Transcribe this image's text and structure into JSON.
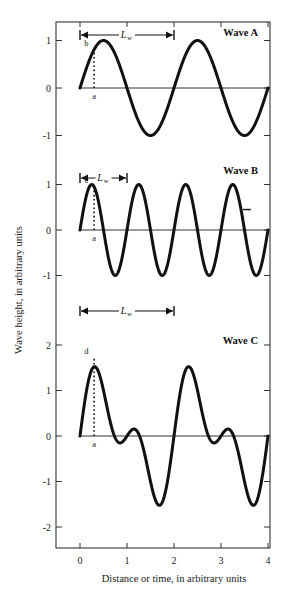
{
  "figure": {
    "xlabel": "Distance or time, in arbitrary units",
    "ylabel": "Wave height, in arbitrary units",
    "x_ticks": [
      "0",
      "1",
      "2",
      "3",
      "4"
    ],
    "wavelength_symbol": "L",
    "wavelength_subscript": "w",
    "line_color": "#111111",
    "axis_color": "#333333"
  },
  "chart_data": {
    "type": "line",
    "title": "",
    "xlabel": "Distance or time, in arbitrary units",
    "ylabel": "Wave height, in arbitrary units",
    "xlim": [
      0,
      4
    ],
    "x_ticks": [
      0,
      1,
      2,
      3,
      4
    ],
    "grid": false,
    "legend": "none",
    "panels": [
      {
        "name": "Wave A",
        "label": "Wave A",
        "ylim": [
          -1.45,
          1.45
        ],
        "y_ticks": [
          1,
          0,
          -1
        ],
        "y_tick_labels": [
          "1",
          "0",
          "-1"
        ],
        "amplitude": 1,
        "wavelength": 2,
        "cycles": 2,
        "formula": "sin(pi*x)",
        "wavelength_arrow": {
          "from": 0,
          "to": 2,
          "label": "Lw"
        },
        "annotations": [
          {
            "id": "b",
            "label": "b",
            "x": 0.3,
            "y": 0.81,
            "on": "curve"
          },
          {
            "id": "a",
            "label": "a",
            "x": 0.3,
            "y": 0.0,
            "on": "baseline"
          }
        ],
        "dotted_line": {
          "x": 0.3,
          "y0": 0.0,
          "y1": 0.81
        }
      },
      {
        "name": "Wave B",
        "label": "Wave B",
        "ylim": [
          -1.45,
          1.45
        ],
        "y_ticks": [
          1,
          0,
          -1
        ],
        "y_tick_labels": [
          "1",
          "0",
          "-1"
        ],
        "amplitude": 1,
        "wavelength": 1,
        "cycles": 4,
        "formula": "sin(2*pi*x)",
        "wavelength_arrow": {
          "from": 0,
          "to": 1,
          "label": "Lw"
        },
        "annotations": [
          {
            "id": "c",
            "label": "c",
            "x": 0.3,
            "y": 0.95,
            "on": "curve"
          },
          {
            "id": "a",
            "label": "a",
            "x": 0.3,
            "y": 0.0,
            "on": "baseline"
          }
        ],
        "dotted_line": {
          "x": 0.3,
          "y0": 0.0,
          "y1": 0.95
        },
        "stray_dash": {
          "x": 3.55,
          "y": 0.45
        }
      },
      {
        "name": "Wave C",
        "label": "Wave C",
        "ylim": [
          -2.45,
          2.45
        ],
        "y_ticks": [
          2,
          1,
          0,
          -1,
          -2
        ],
        "y_tick_labels": [
          "2",
          "1",
          "0",
          "-1",
          "-2"
        ],
        "amplitude": 1.75,
        "wavelength": 2,
        "cycles": 2,
        "formula": "sin(pi*x) + 0.75*sin(2*pi*x)",
        "wavelength_arrow": {
          "from": 0,
          "to": 2,
          "label": "Lw"
        },
        "annotations": [
          {
            "id": "d",
            "label": "d",
            "x": 0.3,
            "y": 1.73,
            "on": "curve"
          },
          {
            "id": "a",
            "label": "a",
            "x": 0.3,
            "y": 0.0,
            "on": "baseline"
          }
        ],
        "dotted_line": {
          "x": 0.3,
          "y0": 0.0,
          "y1": 1.73
        }
      }
    ]
  }
}
